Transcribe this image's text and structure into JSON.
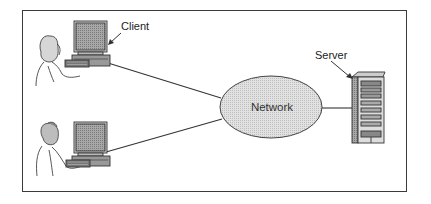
{
  "diagram": {
    "type": "client-server network",
    "nodes": [
      {
        "id": "client1",
        "label": "Client",
        "kind": "workstation-user-female"
      },
      {
        "id": "client2",
        "label": "",
        "kind": "workstation-user-male"
      },
      {
        "id": "network",
        "label": "Network",
        "kind": "ellipse-cloud"
      },
      {
        "id": "server",
        "label": "Server",
        "kind": "tower-server"
      }
    ],
    "edges": [
      {
        "from": "client1",
        "to": "network"
      },
      {
        "from": "client2",
        "to": "network"
      },
      {
        "from": "network",
        "to": "server"
      }
    ]
  },
  "labels": {
    "client": "Client",
    "network": "Network",
    "server": "Server"
  },
  "colors": {
    "frame": "#3a3a3a",
    "network_fill": "#d9d9d9",
    "screen_fill": "#9a9a9a",
    "line": "#333333"
  }
}
